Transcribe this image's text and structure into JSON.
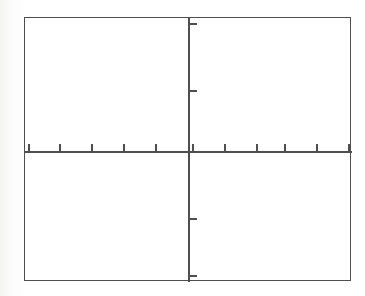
{
  "figure": {
    "kind": "blank-cartesian-grid",
    "title": "",
    "background_color": "#fdfdfd",
    "plot_background_color": "#ffffff",
    "line_color": "#4f4f52",
    "frame": {
      "x": 24,
      "y": 17,
      "width": 327,
      "height": 264,
      "border_width": 1.6
    }
  },
  "chart_data": {
    "type": "scatter",
    "title": "",
    "subtitle": "",
    "xlabel": "",
    "ylabel": "",
    "grid": false,
    "legend_position": "none",
    "annotations": [],
    "series": [
      {
        "name": "",
        "x": [],
        "y": []
      }
    ],
    "x": [],
    "values": [],
    "categories": [],
    "xlim": [
      -5,
      5
    ],
    "ylim": [
      -4,
      4
    ],
    "x_tick_labels": [],
    "y_tick_labels": [],
    "x_ticks": [
      -5,
      -4,
      -3,
      -2,
      -1,
      1,
      2,
      3,
      4,
      5
    ],
    "y_ticks": [
      3.5,
      1.4,
      -1.3,
      -3.1
    ],
    "note": "Empty coordinate axes; no data points are plotted in the figure."
  },
  "axes": {
    "x_axis": {
      "name": "x-axis",
      "y_offset_in_frame": 133,
      "tick_length": 7,
      "tick_direction": "up",
      "tick_offsets_in_frame": [
        3,
        34,
        66,
        98,
        130,
        167,
        199,
        231,
        259,
        291,
        323
      ]
    },
    "y_axis": {
      "name": "y-axis",
      "x_offset_in_frame": 163,
      "tick_length": 7,
      "tick_direction": "right",
      "tick_offsets_in_frame": [
        5,
        72,
        200,
        257
      ]
    }
  }
}
